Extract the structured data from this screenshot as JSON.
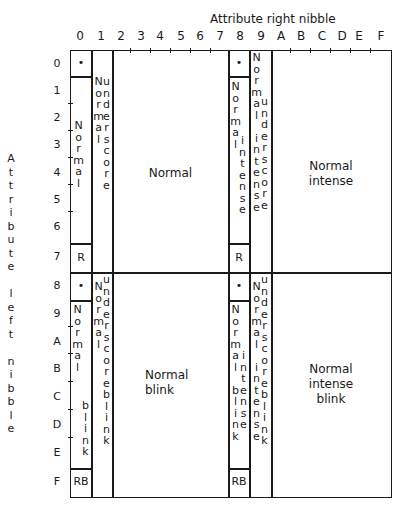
{
  "title": "Attribute right nibble",
  "left_axis_label": "A\nt\nt\nr\ni\nb\nu\nt\ne\n\nl\ne\nf\nt\n\nn\ni\nb\nb\nl\ne",
  "column_headers": [
    "0",
    "1",
    "2",
    "3",
    "4",
    "5",
    "6",
    "7",
    "8",
    "9",
    "A",
    "B",
    "C",
    "D",
    "E",
    "F"
  ],
  "row_headers": [
    "0",
    "1",
    "2",
    "3",
    "4",
    "5",
    "6",
    "7",
    "8",
    "9",
    "A",
    "B",
    "C",
    "D",
    "E",
    "F"
  ],
  "cells": {
    "top_col0_row0": "•",
    "top_col0_vertical": "N\no\nr\nm\na\nl",
    "top_col0_row7": "R",
    "top_col1_vertical_a": "N\no\nr\nm\na\nl",
    "top_col1_vertical_b": "u\nn\nd\ne\nr\ns\nc\no\nr\ne",
    "top_main": "Normal",
    "top_col8_row0": "•",
    "top_col8_vertical_a": "N\no\nr\nm\na\nl",
    "top_col8_vertical_b": "i\nn\nt\ne\nn\ns\ne",
    "top_col8_row7": "R",
    "top_col9_vertical_a": "N\no\nr\nm\na\nl\n\ni\nn\nt\ne\nn\ns\ne",
    "top_col9_vertical_b": "u\nn\nd\ne\nr\ns\nc\no\nr\ne",
    "top_right": "Normal\nintense",
    "bot_col0_row8": "•",
    "bot_col0_vertical_a": "N\no\nr\nm\na\nl",
    "bot_col0_vertical_b": "b\nl\ni\nn\nk",
    "bot_col0_rowF": "RB",
    "bot_col1_vertical_a": "N\no\nr\nm\na\nl",
    "bot_col1_vertical_b": "u\nn\nd\ne\nr\ns\nc\no\nr\ne\nb\nl\ni\nn\nk",
    "bot_main": "Normal\nblink",
    "bot_col8_row8": "•",
    "bot_col8_vertical_a": "N\no\nr\nm\na\nl\n\nb\nl\ni\nn\nk",
    "bot_col8_vertical_b": "i\nn\nt\ne\nn\ns\ne",
    "bot_col8_rowF": "RB",
    "bot_col9_vertical_a": "N\no\nr\nm\na\nl\n\ni\nn\nt\ne\nn\ns\ne",
    "bot_col9_vertical_b": "u\nn\nd\ne\nr\ns\nc\no\nr\ne\nb\nl\ni\nn\nk",
    "bot_right": "Normal\nintense\nblink"
  }
}
